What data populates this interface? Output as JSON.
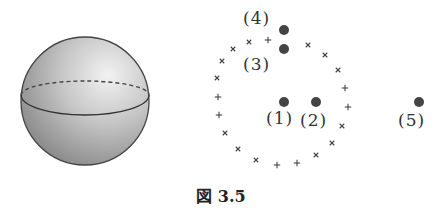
{
  "figure": {
    "caption": "図 3.5",
    "sphere": {
      "center": [
        85,
        101
      ],
      "radius": 64,
      "fill_light": "#e6e6e6",
      "fill_dark": "#8f8f8f",
      "outline": "#444444"
    },
    "ring": {
      "center": [
        285,
        107
      ],
      "radius": 70,
      "marker_color": "#444444",
      "markers": [
        {
          "x": 268,
          "y": 40,
          "type": "plus"
        },
        {
          "x": 249,
          "y": 42,
          "type": "cross"
        },
        {
          "x": 233,
          "y": 49,
          "type": "cross"
        },
        {
          "x": 222,
          "y": 61,
          "type": "cross"
        },
        {
          "x": 217,
          "y": 78,
          "type": "cross"
        },
        {
          "x": 218,
          "y": 97,
          "type": "plus"
        },
        {
          "x": 219,
          "y": 115,
          "type": "plus"
        },
        {
          "x": 225,
          "y": 133,
          "type": "cross"
        },
        {
          "x": 238,
          "y": 149,
          "type": "cross"
        },
        {
          "x": 256,
          "y": 160,
          "type": "cross"
        },
        {
          "x": 277,
          "y": 165,
          "type": "plus"
        },
        {
          "x": 297,
          "y": 163,
          "type": "plus"
        },
        {
          "x": 316,
          "y": 155,
          "type": "cross"
        },
        {
          "x": 332,
          "y": 143,
          "type": "cross"
        },
        {
          "x": 342,
          "y": 126,
          "type": "cross"
        },
        {
          "x": 348,
          "y": 107,
          "type": "plus"
        },
        {
          "x": 345,
          "y": 88,
          "type": "plus"
        },
        {
          "x": 338,
          "y": 70,
          "type": "cross"
        },
        {
          "x": 325,
          "y": 55,
          "type": "cross"
        },
        {
          "x": 308,
          "y": 45,
          "type": "cross"
        }
      ]
    },
    "points": [
      {
        "id": "1",
        "label": "(1)",
        "x": 284,
        "y": 102,
        "label_x": 266,
        "label_y": 108
      },
      {
        "id": "2",
        "label": "(2)",
        "x": 316,
        "y": 102,
        "label_x": 300,
        "label_y": 110
      },
      {
        "id": "3",
        "label": "(3)",
        "x": 284,
        "y": 49,
        "label_x": 243,
        "label_y": 54
      },
      {
        "id": "4",
        "label": "(4)",
        "x": 284,
        "y": 30,
        "label_x": 243,
        "label_y": 8
      },
      {
        "id": "5",
        "label": "(5)",
        "x": 419,
        "y": 102,
        "label_x": 398,
        "label_y": 110
      }
    ],
    "point_color": "#444444"
  }
}
